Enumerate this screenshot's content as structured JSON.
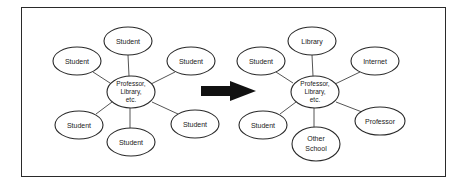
{
  "diagram": {
    "colors": {
      "stroke": "#2a2a2a",
      "line": "#555555",
      "fill": "#ffffff",
      "arrow": "#111111",
      "text": "#1a1a1a"
    },
    "left": {
      "hub": {
        "lines": [
          "Professor,",
          "Library,",
          "etc."
        ]
      },
      "nodes": [
        {
          "label": "Student",
          "position": "top"
        },
        {
          "label": "Student",
          "position": "upper-left"
        },
        {
          "label": "Student",
          "position": "upper-right"
        },
        {
          "label": "Student",
          "position": "lower-left"
        },
        {
          "label": "Student",
          "position": "bottom"
        },
        {
          "label": "Student",
          "position": "lower-right"
        }
      ]
    },
    "arrow": {
      "direction": "right"
    },
    "right": {
      "hub": {
        "lines": [
          "Professor,",
          "Library,",
          "etc."
        ]
      },
      "nodes": [
        {
          "label": "Library",
          "position": "top"
        },
        {
          "label": "Student",
          "position": "upper-left"
        },
        {
          "label": "Internet",
          "position": "upper-right"
        },
        {
          "label": "Student",
          "position": "lower-left"
        },
        {
          "label": "Other",
          "label2": "School",
          "position": "bottom"
        },
        {
          "label": "Professor",
          "position": "lower-right"
        }
      ]
    }
  }
}
